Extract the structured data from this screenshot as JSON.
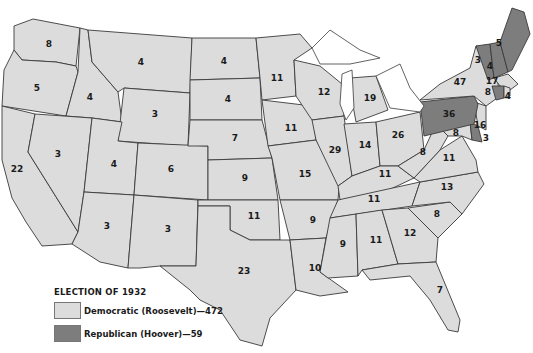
{
  "legend": {
    "title": "ELECTION OF 1932",
    "items": [
      {
        "label": "Democratic (Roosevelt)—472",
        "color": "#dcdcdc"
      },
      {
        "label": "Republican (Hoover)—59",
        "color": "#7d7d7d"
      }
    ]
  },
  "states": {
    "WA": "8",
    "OR": "5",
    "CA": "22",
    "ID": "4",
    "NV": "3",
    "MT": "4",
    "WY": "3",
    "UT": "4",
    "CO": "6",
    "AZ": "3",
    "NM": "3",
    "ND": "4",
    "SD": "4",
    "NE": "7",
    "KS": "9",
    "OK": "11",
    "TX": "23",
    "MN": "11",
    "IA": "11",
    "MO": "15",
    "AR": "9",
    "LA": "10",
    "WI": "12",
    "IL": "29",
    "MI": "19",
    "IN": "14",
    "OH": "26",
    "KY": "11",
    "TN": "11",
    "MS": "9",
    "AL": "11",
    "GA": "12",
    "FL": "7",
    "SC": "8",
    "NC": "13",
    "VA": "11",
    "WV": "8",
    "MD": "8",
    "DE": "3",
    "NJ": "16",
    "PA": "36",
    "NY": "47",
    "VT": "3",
    "NH": "4",
    "ME": "5",
    "MA": "17",
    "CT": "8",
    "RI": "4"
  }
}
